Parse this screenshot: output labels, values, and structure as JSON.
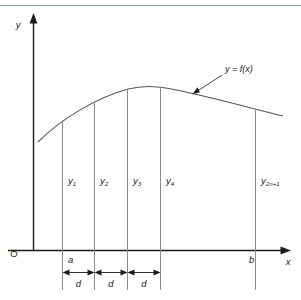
{
  "figure": {
    "axes": {
      "y_label": "y",
      "x_label": "x",
      "origin_label": "O"
    },
    "x_ticks": [
      {
        "key": "a",
        "label": "a"
      },
      {
        "key": "b",
        "label": "b"
      }
    ],
    "curve_label": "y = f(x)",
    "ordinate_labels": [
      {
        "base": "y",
        "sub": "1"
      },
      {
        "base": "y",
        "sub": "2"
      },
      {
        "base": "y",
        "sub": "3"
      },
      {
        "base": "y",
        "sub": "4"
      },
      {
        "base": "y",
        "sub": "2n+1"
      }
    ],
    "interval_labels": [
      "d",
      "d",
      "d"
    ],
    "colors": {
      "axis": "#1a1a1a",
      "ordinate": "#8a8a8a",
      "curve": "#555555",
      "topbar": "#7b96b8",
      "background": "#ffffff",
      "text": "#1a1a1a"
    }
  }
}
